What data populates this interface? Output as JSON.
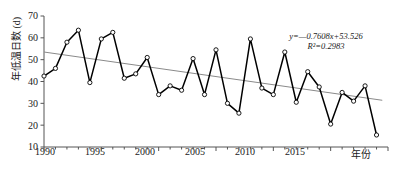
{
  "figure": {
    "type": "line-chart",
    "caption": ""
  },
  "axes": {
    "y_title": "年低温日数 (d)",
    "x_title": "年份",
    "y_ticks": [
      "10",
      "20",
      "30",
      "40",
      "50",
      "60",
      "70"
    ],
    "x_ticks": [
      "1990",
      "1995",
      "2000",
      "2005",
      "2010",
      "2015"
    ]
  },
  "annotation": {
    "equation": "y=—0.7608x+53.526",
    "r_squared": "R²=0.2983"
  },
  "colors": {
    "series_line": "#000000",
    "marker_fill": "#ffffff",
    "marker_stroke": "#000000",
    "trend_line": "#8a8a8a",
    "axis": "#555555",
    "background": "#ffffff"
  },
  "chart_data": {
    "type": "line",
    "title": "",
    "xlabel": "年份",
    "ylabel": "年低温日数 (d)",
    "xlim": [
      1990,
      2020
    ],
    "ylim": [
      10,
      70
    ],
    "ytick_step": 10,
    "xtick_major_step": 5,
    "xtick_minor_step": 1,
    "grid": false,
    "legend": "none",
    "x": [
      1990,
      1991,
      1992,
      1993,
      1994,
      1995,
      1996,
      1997,
      1998,
      1999,
      2000,
      2001,
      2002,
      2003,
      2004,
      2005,
      2006,
      2007,
      2008,
      2009,
      2010,
      2011,
      2012,
      2013,
      2014,
      2015,
      2016,
      2017,
      2018,
      2019
    ],
    "series": [
      {
        "name": "年低温日数",
        "marker": "open-circle",
        "values": [
          42.5,
          46,
          58,
          63.5,
          39.5,
          59.5,
          62.5,
          41.5,
          43.5,
          51,
          34,
          38,
          36,
          50.5,
          34,
          54.5,
          30,
          25.5,
          59.5,
          37,
          34,
          53.5,
          30.5,
          44.5,
          37.5,
          20.5,
          35,
          31,
          38,
          15.5
        ]
      }
    ],
    "trendline": {
      "type": "linear",
      "slope": -0.7608,
      "intercept": 53.526,
      "r_squared": 0.2983,
      "label": "y=—0.7608x+53.526",
      "r_label": "R²=0.2983",
      "y_start": 53.5,
      "y_end": 31.4
    }
  }
}
